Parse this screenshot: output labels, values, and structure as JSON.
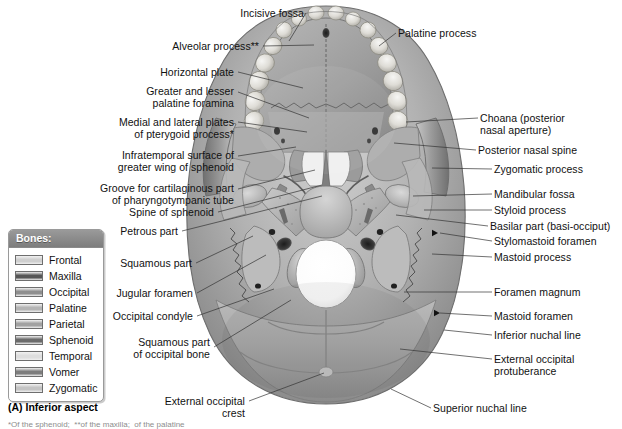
{
  "figure": {
    "caption": "(A) Inferior aspect",
    "footnote": "*Of the sphenoid;  **of the maxilla;  of the palatine"
  },
  "legend": {
    "title": "Bones:",
    "items": [
      {
        "label": "Frontal",
        "color": "#cfcfcf"
      },
      {
        "label": "Maxilla",
        "color": "#565656"
      },
      {
        "label": "Occipital",
        "color": "#8e8e8e"
      },
      {
        "label": "Palatine",
        "color": "#b5b5b5"
      },
      {
        "label": "Parietal",
        "color": "#a2a2a2"
      },
      {
        "label": "Sphenoid",
        "color": "#6b6b6b"
      },
      {
        "label": "Temporal",
        "color": "#dedede"
      },
      {
        "label": "Vomer",
        "color": "#7d7d7d"
      },
      {
        "label": "Zygomatic",
        "color": "#c4c4c4"
      }
    ]
  },
  "labels_left": [
    {
      "text": "Incisive fossa",
      "x": 222,
      "y": 8,
      "w": 82
    },
    {
      "text": "Alveolar process**",
      "x": 155,
      "y": 41,
      "w": 104
    },
    {
      "text": "Horizontal plate",
      "x": 146,
      "y": 67,
      "w": 88
    },
    {
      "text": "Greater and lesser\npalatine foramina",
      "x": 110,
      "y": 86,
      "w": 124
    },
    {
      "text": "Medial and lateral plates\nof pterygoid process*",
      "x": 73,
      "y": 117,
      "w": 161
    },
    {
      "text": "Infratemporal surface of\ngreater wing of sphenoid",
      "x": 67,
      "y": 150,
      "w": 167
    },
    {
      "text": "Groove for cartilaginous part\nof pharyngotympanic tube",
      "x": 39,
      "y": 183,
      "w": 195
    },
    {
      "text": "Spine of sphenoid",
      "x": 113,
      "y": 207,
      "w": 101
    },
    {
      "text": "Petrous part",
      "x": 109,
      "y": 226,
      "w": 69
    },
    {
      "text": "Squamous part",
      "x": 110,
      "y": 258,
      "w": 82
    },
    {
      "text": "Jugular foramen",
      "x": 107,
      "y": 288,
      "w": 86
    },
    {
      "text": "Occipital condyle",
      "x": 105,
      "y": 311,
      "w": 88
    },
    {
      "text": "Squamous part\nof occipital bone",
      "x": 116,
      "y": 337,
      "w": 94
    },
    {
      "text": "External occipital\ncrest",
      "x": 152,
      "y": 396,
      "w": 93
    }
  ],
  "labels_right": [
    {
      "text": "Palatine process",
      "x": 398,
      "y": 28,
      "w": 90
    },
    {
      "text": "Choana (posterior\nnasal aperture)",
      "x": 480,
      "y": 113,
      "w": 99
    },
    {
      "text": "Posterior nasal spine",
      "x": 478,
      "y": 145,
      "w": 114
    },
    {
      "text": "Zygomatic process",
      "x": 494,
      "y": 164,
      "w": 103
    },
    {
      "text": "Mandibular fossa",
      "x": 494,
      "y": 189,
      "w": 99
    },
    {
      "text": "Styloid process",
      "x": 494,
      "y": 205,
      "w": 85
    },
    {
      "text": "Basilar part (basi-occiput)",
      "x": 490,
      "y": 221,
      "w": 131
    },
    {
      "text": "Stylomastoid foramen",
      "x": 494,
      "y": 236,
      "w": 124
    },
    {
      "text": "Mastoid process",
      "x": 494,
      "y": 252,
      "w": 93
    },
    {
      "text": "Foramen magnum",
      "x": 494,
      "y": 287,
      "w": 105
    },
    {
      "text": "Mastoid foramen",
      "x": 494,
      "y": 311,
      "w": 95
    },
    {
      "text": "Inferior nuchal line",
      "x": 494,
      "y": 330,
      "w": 101
    },
    {
      "text": "External occipital\nprotuberance",
      "x": 494,
      "y": 354,
      "w": 98
    },
    {
      "text": "Superior nuchal line",
      "x": 433,
      "y": 403,
      "w": 108
    }
  ],
  "leaders_left": [
    {
      "x1": 306,
      "y1": 13,
      "x2": 289,
      "y2": 41
    },
    {
      "x1": 263,
      "y1": 46,
      "x2": 314,
      "y2": 45
    },
    {
      "x1": 238,
      "y1": 72,
      "x2": 303,
      "y2": 88
    },
    {
      "x1": 238,
      "y1": 92,
      "x2": 309,
      "y2": 118
    },
    {
      "x1": 238,
      "y1": 122,
      "x2": 307,
      "y2": 132
    },
    {
      "x1": 238,
      "y1": 156,
      "x2": 296,
      "y2": 147
    },
    {
      "x1": 238,
      "y1": 189,
      "x2": 315,
      "y2": 170
    },
    {
      "x1": 218,
      "y1": 212,
      "x2": 322,
      "y2": 185
    },
    {
      "x1": 182,
      "y1": 231,
      "x2": 322,
      "y2": 196
    },
    {
      "x1": 196,
      "y1": 263,
      "x2": 253,
      "y2": 236
    },
    {
      "x1": 197,
      "y1": 293,
      "x2": 266,
      "y2": 255
    },
    {
      "x1": 197,
      "y1": 316,
      "x2": 274,
      "y2": 289
    },
    {
      "x1": 214,
      "y1": 347,
      "x2": 291,
      "y2": 300
    },
    {
      "x1": 249,
      "y1": 401,
      "x2": 324,
      "y2": 373
    }
  ],
  "leaders_right": [
    {
      "x1": 396,
      "y1": 33,
      "x2": 379,
      "y2": 46
    },
    {
      "x1": 478,
      "y1": 118,
      "x2": 406,
      "y2": 122
    },
    {
      "x1": 476,
      "y1": 150,
      "x2": 394,
      "y2": 143
    },
    {
      "x1": 492,
      "y1": 169,
      "x2": 432,
      "y2": 168
    },
    {
      "x1": 492,
      "y1": 194,
      "x2": 413,
      "y2": 196
    },
    {
      "x1": 492,
      "y1": 210,
      "x2": 424,
      "y2": 210
    },
    {
      "x1": 488,
      "y1": 226,
      "x2": 396,
      "y2": 215
    },
    {
      "x1": 492,
      "y1": 241,
      "x2": 440,
      "y2": 233
    },
    {
      "x1": 492,
      "y1": 257,
      "x2": 432,
      "y2": 254
    },
    {
      "x1": 492,
      "y1": 292,
      "x2": 404,
      "y2": 292
    },
    {
      "x1": 492,
      "y1": 316,
      "x2": 440,
      "y2": 313
    },
    {
      "x1": 492,
      "y1": 335,
      "x2": 444,
      "y2": 330
    },
    {
      "x1": 492,
      "y1": 359,
      "x2": 400,
      "y2": 349
    },
    {
      "x1": 431,
      "y1": 408,
      "x2": 391,
      "y2": 389
    }
  ],
  "arrow_markers": [
    {
      "x": 438,
      "y": 233,
      "dir": "left"
    },
    {
      "x": 440,
      "y": 313,
      "dir": "left"
    }
  ]
}
